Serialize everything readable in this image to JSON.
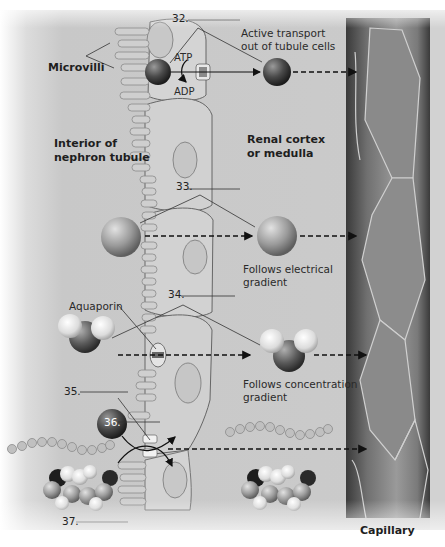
{
  "diagram": {
    "regions": {
      "lumen": "Interior of nephron tubule",
      "interstitium": "Renal cortex or medulla",
      "capillary": "Capillary"
    },
    "labels": {
      "microvilli": "Microvilli",
      "atp": "ATP",
      "adp": "ADP",
      "active_transport": [
        "Active transport",
        "out of tubule cells"
      ],
      "electrical": [
        "Follows electrical",
        "gradient"
      ],
      "aquaporin": "Aquaporin",
      "concentration": [
        "Follows concentration",
        "gradient"
      ]
    },
    "blanks": [
      {
        "number": "32.",
        "answer": ""
      },
      {
        "number": "33.",
        "answer": ""
      },
      {
        "number": "34.",
        "answer": ""
      },
      {
        "number": "35.",
        "answer": ""
      },
      {
        "number": "36.",
        "answer": ""
      },
      {
        "number": "37.",
        "answer": ""
      }
    ],
    "molecules": [
      {
        "id": "sodium-ion",
        "row": 1,
        "mechanism": "active transport"
      },
      {
        "id": "chloride-ion",
        "row": 2,
        "mechanism": "electrical gradient"
      },
      {
        "id": "water-molecule",
        "row": 3,
        "mechanism": "concentration gradient via aquaporin"
      },
      {
        "id": "cotransported-solutes",
        "row": 4,
        "mechanism": "cotransport (amino acid chain, glucose)"
      }
    ],
    "colors": {
      "background": "#ffffff",
      "tissue": "#c9c9c9",
      "cell": "#d6d6d6",
      "capillary_dark": "#3a3a3a",
      "capillary_light": "#8e8e8e",
      "text": "#222222"
    }
  }
}
